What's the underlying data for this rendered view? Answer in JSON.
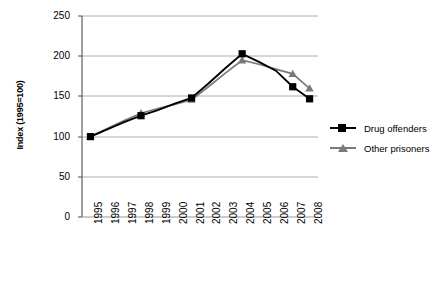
{
  "chart_data": {
    "type": "line",
    "title": "",
    "xlabel": "",
    "ylabel": "Index (1995=100)",
    "categories": [
      "1995",
      "1996",
      "1997",
      "1998",
      "1999",
      "2000",
      "2001",
      "2002",
      "2003",
      "2004",
      "2005",
      "2006",
      "2007",
      "2008"
    ],
    "ylim": [
      0,
      250
    ],
    "yticks": [
      0,
      50,
      100,
      150,
      200,
      250
    ],
    "grid": true,
    "legend_position": "right",
    "series": [
      {
        "name": "Drug offenders",
        "marker": "square",
        "color": "#000000",
        "marker_points": {
          "1995": 100,
          "1998": 126,
          "2001": 148,
          "2004": 203,
          "2007": 162,
          "2008": 147
        },
        "values": [
          100,
          109,
          118,
          126,
          133,
          141,
          148,
          166,
          185,
          203,
          193,
          182,
          162,
          147
        ]
      },
      {
        "name": "Other prisoners",
        "marker": "triangle",
        "color": "#7a7a7a",
        "marker_points": {
          "1995": 100,
          "1998": 129,
          "2001": 146,
          "2004": 195,
          "2007": 178,
          "2008": 160
        },
        "values": [
          100,
          110,
          120,
          129,
          135,
          140,
          146,
          162,
          179,
          195,
          190,
          184,
          178,
          160
        ]
      }
    ]
  },
  "legend": {
    "items": [
      {
        "label": "Drug offenders",
        "marker": "square-marker",
        "color": "#000000"
      },
      {
        "label": "Other prisoners",
        "marker": "triangle-marker",
        "color": "#7a7a7a"
      }
    ]
  },
  "axes": {
    "y_title": "Index (1995=100)",
    "y_ticks": [
      "0",
      "50",
      "100",
      "150",
      "200",
      "250"
    ],
    "x_ticks": [
      "1995",
      "1996",
      "1997",
      "1998",
      "1999",
      "2000",
      "2001",
      "2002",
      "2003",
      "2004",
      "2005",
      "2006",
      "2007",
      "2008"
    ]
  }
}
